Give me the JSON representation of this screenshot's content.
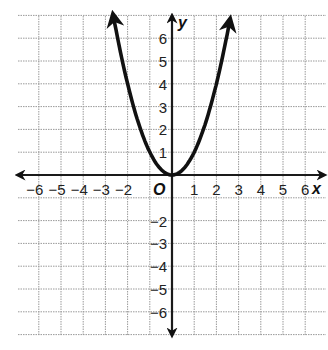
{
  "chart_data": {
    "type": "line",
    "title": "",
    "xlabel": "x",
    "ylabel": "y",
    "origin_label": "O",
    "function": "y = x^2",
    "xlim": [
      -7,
      7
    ],
    "ylim": [
      -7,
      7
    ],
    "grid": true,
    "x_ticks": [
      -6,
      -5,
      -4,
      -3,
      -2,
      1,
      2,
      3,
      4,
      5,
      6
    ],
    "y_ticks": [
      1,
      2,
      3,
      4,
      5,
      6,
      -2,
      -3,
      -4,
      -5,
      -6
    ],
    "x_tick_labels": [
      "−6",
      "−5",
      "−4",
      "−3",
      "−2",
      "1",
      "2",
      "3",
      "4",
      "5",
      "6"
    ],
    "y_tick_labels": [
      "1",
      "2",
      "3",
      "4",
      "5",
      "6",
      "−2",
      "−3",
      "−4",
      "−5",
      "−6"
    ],
    "series": [
      {
        "name": "parabola",
        "x": [
          -2.6,
          -2,
          -1.5,
          -1,
          -0.5,
          0,
          0.5,
          1,
          1.5,
          2,
          2.6
        ],
        "y": [
          6.76,
          4,
          2.25,
          1,
          0.25,
          0,
          0.25,
          1,
          2.25,
          4,
          6.76
        ],
        "arrows": "both ends"
      }
    ],
    "colors": {
      "curve": "#111111",
      "axis": "#1a1a1a",
      "grid": "#9a9a9a"
    }
  }
}
